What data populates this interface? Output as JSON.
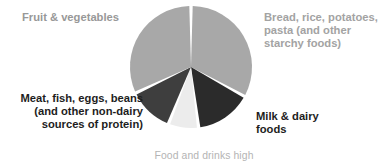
{
  "chart_data": {
    "type": "pie",
    "title": "",
    "subtitle": "",
    "xlabel": "",
    "ylabel": "",
    "grid": false,
    "legend_position": "around-slices",
    "center": {
      "x": 191,
      "y": 67
    },
    "radius": 61,
    "gap_degrees": 3.2,
    "start_angle_degrees": 0,
    "background_color": "#ffffff",
    "categories": [
      "Bread, rice, potatoes, pasta (and other starchy foods)",
      "Milk & dairy foods",
      "Food and drinks high in fat and sugar",
      "Meat, fish, eggs, beans (and other non-dairy sources of protein)",
      "Fruit & vegetables"
    ],
    "values": [
      33,
      15,
      8,
      12,
      32
    ],
    "colors": [
      "#a8a8a8",
      "#2b2b2b",
      "#ececec",
      "#3e3e3e",
      "#a8a8a8"
    ],
    "slices": [
      {
        "name": "bread-rice-potatoes-pasta",
        "label": "Bread, rice, potatoes,\npasta (and other\nstarchy foods)",
        "value": 33,
        "start_angle": 0,
        "end_angle": 118.8,
        "color": "#a8a8a8",
        "label_color": "#a3a3a3"
      },
      {
        "name": "milk-dairy-foods",
        "label": "Milk & dairy\nfoods",
        "value": 15,
        "start_angle": 118.8,
        "end_angle": 172.8,
        "color": "#2b2b2b",
        "label_color": "#1d1d1d"
      },
      {
        "name": "food-drinks-high-in-fat-and-sugar",
        "label": "Food and drinks high",
        "value": 8,
        "start_angle": 172.8,
        "end_angle": 201.6,
        "color": "#ececec",
        "label_color": "#b4b4b4"
      },
      {
        "name": "meat-fish-eggs-beans",
        "label": "Meat, fish, eggs, beans\n(and other non-dairy\nsources of protein)",
        "value": 12,
        "start_angle": 201.6,
        "end_angle": 244.8,
        "color": "#3e3e3e",
        "label_color": "#1d1d1d"
      },
      {
        "name": "fruit-vegetables",
        "label": "Fruit & vegetables",
        "value": 32,
        "start_angle": 244.8,
        "end_angle": 360,
        "color": "#a8a8a8",
        "label_color": "#989898"
      }
    ]
  },
  "labels": {
    "fruit_vegetables": "Fruit & vegetables",
    "bread_rice": "Bread, rice, potatoes,\npasta (and other\nstarchy foods)",
    "meat_fish": "Meat, fish, eggs, beans\n(and other non-dairy\nsources of protein)",
    "milk_dairy": "Milk & dairy\nfoods",
    "fatty_foods": "Food and drinks high"
  }
}
